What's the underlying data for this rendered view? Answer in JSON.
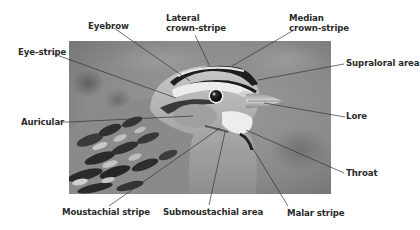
{
  "diagram": {
    "photo_style": "grayscale",
    "colors": {
      "label_text": "#2b2b2b",
      "leader_line": "#333333",
      "background": "#ffffff"
    }
  },
  "labels": {
    "eyebrow": {
      "text": "Eyebrow"
    },
    "lateral_crown_stripe": {
      "line1": "Lateral",
      "line2": "crown-stripe"
    },
    "median_crown_stripe": {
      "line1": "Median",
      "line2": "crown-stripe"
    },
    "eye_stripe": {
      "text": "Eye-stripe"
    },
    "supraloral_area": {
      "text": "Supraloral area"
    },
    "lore": {
      "text": "Lore"
    },
    "auricular": {
      "text": "Auricular"
    },
    "throat": {
      "text": "Throat"
    },
    "moustachial_stripe": {
      "text": "Moustachial stripe"
    },
    "submoustachial_area": {
      "text": "Submoustachial area"
    },
    "malar_stripe": {
      "text": "Malar stripe"
    }
  }
}
